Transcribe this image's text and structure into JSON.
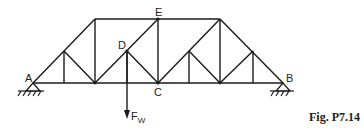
{
  "figure": {
    "caption": "Fig. P7.14",
    "labels": {
      "A": "A",
      "B": "B",
      "C": "C",
      "D": "D",
      "E": "E",
      "force": "F",
      "force_sub": "W"
    },
    "colors": {
      "line": "#1a1a1a",
      "background": "#ffffff"
    }
  }
}
